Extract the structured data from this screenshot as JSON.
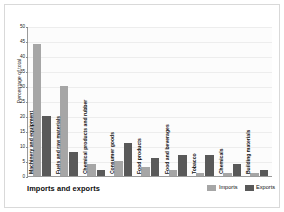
{
  "chart_data": {
    "type": "bar",
    "title": "Imports and exports",
    "xlabel": "",
    "ylabel": "Percentage of total",
    "ylim": [
      0,
      50
    ],
    "ytick_step": 5,
    "yticks": [
      0,
      5,
      10,
      15,
      20,
      25,
      30,
      35,
      40,
      45,
      50
    ],
    "grid": true,
    "legend_position": "bottom-right",
    "categories": [
      "Machinery and equipment",
      "Fuels and raw materials",
      "Chemical products and rubber",
      "Consumer goods",
      "Food products",
      "Food and beverages",
      "Tobacco",
      "Chemicals",
      "Building materials"
    ],
    "series": [
      {
        "name": "Imports",
        "color": "#a6a6a6",
        "values": [
          44,
          30,
          4,
          5,
          3,
          2,
          1,
          1,
          1
        ]
      },
      {
        "name": "Exports",
        "color": "#595959",
        "values": [
          20,
          8,
          2,
          11,
          6,
          7,
          7,
          4,
          2
        ]
      }
    ]
  },
  "legend": {
    "items": [
      {
        "label": "Imports",
        "color": "#a6a6a6"
      },
      {
        "label": "Exports",
        "color": "#595959"
      }
    ]
  },
  "colors": {
    "imports": "#a6a6a6",
    "exports": "#595959",
    "axis": "#9a9a9a",
    "grid": "#ededed",
    "frame": "#d9d9d9",
    "text": "#111111"
  }
}
